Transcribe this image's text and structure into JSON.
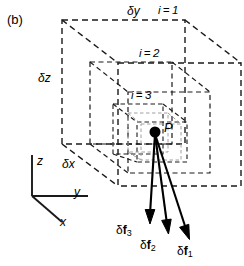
{
  "figure": {
    "panel_label": "(b)",
    "type": "nested-cube-force-diagram"
  },
  "dimension_labels": [
    {
      "id": "dy",
      "text": "δy",
      "x": 127,
      "y": 12,
      "axis": "y"
    },
    {
      "id": "dz",
      "text": "δz",
      "x": 38,
      "y": 78,
      "axis": "z"
    },
    {
      "id": "dx",
      "text": "δx",
      "x": 62,
      "y": 164,
      "axis": "x"
    }
  ],
  "cube_labels": [
    {
      "id": "i1",
      "text": "i = 1",
      "x": 158,
      "y": 12,
      "index": 1
    },
    {
      "id": "i2",
      "text": "i = 2",
      "x": 139,
      "y": 55,
      "index": 2
    },
    {
      "id": "i3",
      "text": "i = 3",
      "x": 131,
      "y": 97,
      "index": 3
    }
  ],
  "point": {
    "label": "P",
    "x": 155,
    "y": 132,
    "label_x": 164,
    "label_y": 127,
    "radius": 5.5
  },
  "force_labels": [
    {
      "id": "f3",
      "prefix": "δ",
      "symbol": "f",
      "sub": "3",
      "x": 128,
      "y": 232
    },
    {
      "id": "f2",
      "prefix": "δ",
      "symbol": "f",
      "sub": "2",
      "x": 152,
      "y": 247
    },
    {
      "id": "f1",
      "prefix": "δ",
      "symbol": "f",
      "sub": "1",
      "x": 186,
      "y": 253
    }
  ],
  "axis_labels": [
    {
      "id": "z",
      "text": "z",
      "x": 37,
      "y": 163
    },
    {
      "id": "y",
      "text": "y",
      "x": 74,
      "y": 196
    },
    {
      "id": "x",
      "text": "x",
      "x": 60,
      "y": 225
    }
  ],
  "colors": {
    "stroke": "#1a1a1a",
    "inner_stroke": "#9a9a9a",
    "background": "#ffffff"
  }
}
